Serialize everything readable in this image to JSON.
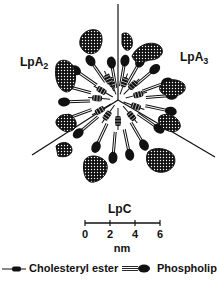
{
  "regions": {
    "left": {
      "base": "LpA",
      "sub": "2"
    },
    "right": {
      "base": "LpA",
      "sub": "3"
    },
    "bottom": {
      "label": "LpC"
    }
  },
  "scale_bar": {
    "ticks": [
      "0",
      "2",
      "4",
      "6"
    ],
    "unit": "nm"
  },
  "legend": {
    "items": [
      {
        "label": "Cholesteryl ester",
        "icon": "cholesteryl-ester-icon"
      },
      {
        "label": "Phospholipi",
        "icon": "phospholipid-icon"
      }
    ]
  },
  "colors": {
    "ink": "#111111",
    "background": "#ffffff"
  }
}
